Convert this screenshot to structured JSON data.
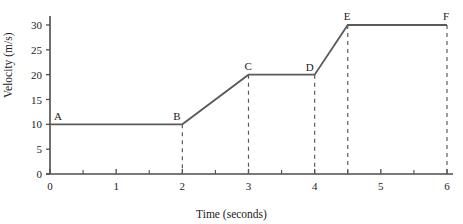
{
  "chart_data": {
    "type": "line",
    "title": "",
    "xlabel": "Time (seconds)",
    "ylabel": "Velocity (m/s)",
    "xlim": [
      0,
      6
    ],
    "ylim": [
      0,
      30
    ],
    "grid": false,
    "legend": "none",
    "line_color": "#5a5a5a",
    "axis_color": "#4d4d4d",
    "text_color": "#1a1a1a",
    "x_ticks": [
      0,
      1,
      2,
      3,
      4,
      5,
      6
    ],
    "x_tick_labels": [
      "0",
      "1",
      "2",
      "3",
      "4",
      "5",
      "6"
    ],
    "x_minor_ticks": [
      0.5,
      1.5,
      2.5,
      3.5,
      4.5,
      5.5
    ],
    "y_ticks": [
      0,
      5,
      10,
      15,
      20,
      25,
      30
    ],
    "y_tick_labels": [
      "0",
      "5",
      "10",
      "15",
      "20",
      "25",
      "30"
    ],
    "x": [
      0,
      2,
      3,
      4,
      4.5,
      6
    ],
    "values": [
      10,
      10,
      20,
      20,
      30,
      30
    ],
    "point_labels": [
      "A",
      "B",
      "C",
      "D",
      "E",
      "F"
    ],
    "points": [
      {
        "label": "A",
        "t": 0,
        "v": 10,
        "dashed_drop": false
      },
      {
        "label": "B",
        "t": 2,
        "v": 10,
        "dashed_drop": true
      },
      {
        "label": "C",
        "t": 3,
        "v": 20,
        "dashed_drop": true
      },
      {
        "label": "D",
        "t": 4,
        "v": 20,
        "dashed_drop": true
      },
      {
        "label": "E",
        "t": 4.5,
        "v": 30,
        "dashed_drop": true
      },
      {
        "label": "F",
        "t": 6,
        "v": 30,
        "dashed_drop": true
      }
    ],
    "segments": [
      {
        "from": "A",
        "to": "B",
        "description": "constant velocity 10 m/s"
      },
      {
        "from": "B",
        "to": "C",
        "description": "acceleration 10 to 20 m/s"
      },
      {
        "from": "C",
        "to": "D",
        "description": "constant velocity 20 m/s"
      },
      {
        "from": "D",
        "to": "E",
        "description": "acceleration 20 to 30 m/s"
      },
      {
        "from": "E",
        "to": "F",
        "description": "constant velocity 30 m/s"
      }
    ]
  },
  "axes": {
    "x_title": "Time (seconds)",
    "y_title": "Velocity (m/s)"
  }
}
